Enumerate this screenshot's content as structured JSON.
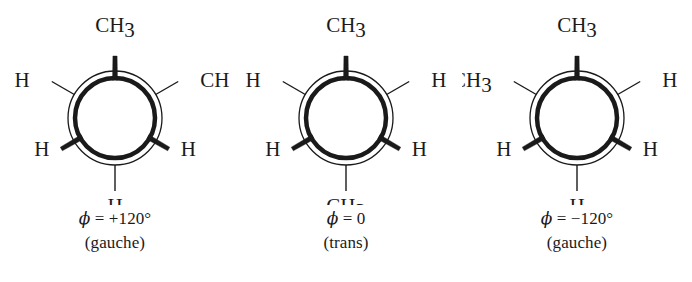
{
  "figure": {
    "background_color": "#ffffff",
    "ink_color": "#1a1a1a"
  },
  "geometry": {
    "center_x": 115,
    "center_y": 118,
    "front_circle_radius": 40,
    "back_circle_radius": 47,
    "front_bond_length": 62,
    "back_bond_length": 26,
    "front_bond_width": 5,
    "back_bond_width": 1.4,
    "front_circle_stroke": 4.5,
    "back_circle_stroke": 1.3
  },
  "panels": [
    {
      "id": "gauche-plus",
      "name": "gauche-plus-120",
      "caption": {
        "angle_symbol": "ϕ",
        "angle_equals": " = ",
        "angle_value": "+120°",
        "angle_line": "ϕ = +120°",
        "conformation": "(gauche)"
      },
      "front_substituents": [
        {
          "position": "top",
          "label": "CH",
          "subscript": "3",
          "angle_deg": 90,
          "bond_type": "front"
        },
        {
          "position": "lower-left",
          "label": "H",
          "subscript": "",
          "angle_deg": 210,
          "bond_type": "front"
        },
        {
          "position": "lower-right",
          "label": "H",
          "subscript": "",
          "angle_deg": 330,
          "bond_type": "front"
        }
      ],
      "back_substituents": [
        {
          "position": "upper-left",
          "label": "H",
          "subscript": "",
          "angle_deg": 150,
          "bond_type": "back"
        },
        {
          "position": "upper-right",
          "label": "CH",
          "subscript": "3",
          "angle_deg": 30,
          "bond_type": "back"
        },
        {
          "position": "bottom",
          "label": "H",
          "subscript": "",
          "angle_deg": 270,
          "bond_type": "back"
        }
      ]
    },
    {
      "id": "trans",
      "name": "trans-0",
      "caption": {
        "angle_symbol": "ϕ",
        "angle_equals": " = ",
        "angle_value": "0",
        "angle_line": "ϕ = 0",
        "conformation": "(trans)"
      },
      "front_substituents": [
        {
          "position": "top",
          "label": "CH",
          "subscript": "3",
          "angle_deg": 90,
          "bond_type": "front"
        },
        {
          "position": "lower-left",
          "label": "H",
          "subscript": "",
          "angle_deg": 210,
          "bond_type": "front"
        },
        {
          "position": "lower-right",
          "label": "H",
          "subscript": "",
          "angle_deg": 330,
          "bond_type": "front"
        }
      ],
      "back_substituents": [
        {
          "position": "upper-left",
          "label": "H",
          "subscript": "",
          "angle_deg": 150,
          "bond_type": "back"
        },
        {
          "position": "upper-right",
          "label": "H",
          "subscript": "",
          "angle_deg": 30,
          "bond_type": "back"
        },
        {
          "position": "bottom",
          "label": "CH",
          "subscript": "3",
          "angle_deg": 270,
          "bond_type": "back"
        }
      ]
    },
    {
      "id": "gauche-minus",
      "name": "gauche-minus-120",
      "caption": {
        "angle_symbol": "ϕ",
        "angle_equals": " = ",
        "angle_value": "−120°",
        "angle_line": "ϕ = −120°",
        "conformation": "(gauche)"
      },
      "front_substituents": [
        {
          "position": "top",
          "label": "CH",
          "subscript": "3",
          "angle_deg": 90,
          "bond_type": "front"
        },
        {
          "position": "lower-left",
          "label": "H",
          "subscript": "",
          "angle_deg": 210,
          "bond_type": "front"
        },
        {
          "position": "lower-right",
          "label": "H",
          "subscript": "",
          "angle_deg": 330,
          "bond_type": "front"
        }
      ],
      "back_substituents": [
        {
          "position": "upper-left",
          "label": "CH",
          "subscript": "3",
          "angle_deg": 150,
          "bond_type": "back"
        },
        {
          "position": "upper-right",
          "label": "H",
          "subscript": "",
          "angle_deg": 30,
          "bond_type": "back"
        },
        {
          "position": "bottom",
          "label": "H",
          "subscript": "",
          "angle_deg": 270,
          "bond_type": "back"
        }
      ]
    }
  ]
}
